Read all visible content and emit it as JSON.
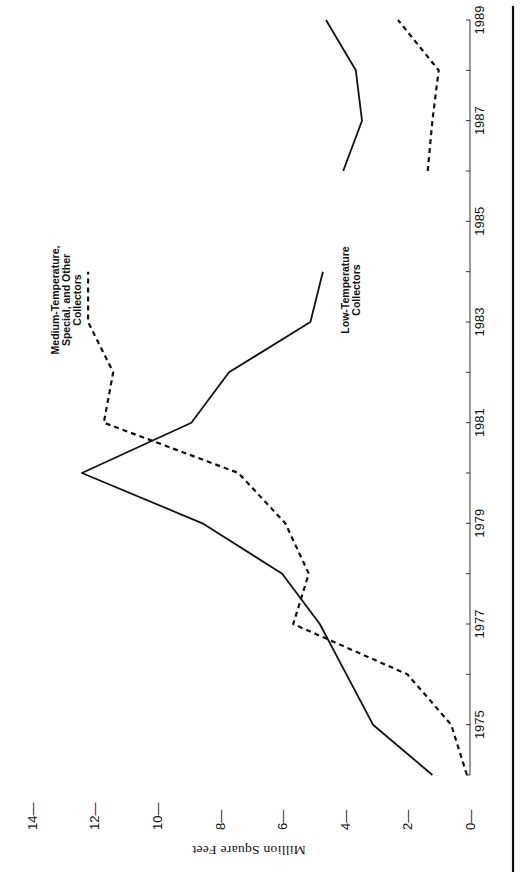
{
  "chart_data": {
    "type": "line",
    "orientation": "rotated-90",
    "title": "",
    "xlabel": "",
    "ylabel": "Million Square Feet",
    "x": [
      1974,
      1975,
      1976,
      1977,
      1978,
      1979,
      1980,
      1981,
      1982,
      1983,
      1984,
      1985,
      1986,
      1987,
      1988,
      1989
    ],
    "x_tick_labels": [
      "1975",
      "1977",
      "1979",
      "1981",
      "1983",
      "1985",
      "1987",
      "1989"
    ],
    "xlim": [
      1974,
      1989
    ],
    "ylim": [
      0,
      14
    ],
    "y_ticks": [
      0,
      2,
      4,
      6,
      8,
      10,
      12,
      14
    ],
    "y_tick_labels": [
      "0",
      "2",
      "4",
      "6",
      "8",
      "10",
      "12",
      "14"
    ],
    "grid": false,
    "legend": "inline labels",
    "series": [
      {
        "name": "Low-Temperature Collectors",
        "label_lines": [
          "Low-Temperature",
          "Collectors"
        ],
        "style": "solid",
        "color": "#111111",
        "values": [
          1.2,
          3.1,
          3.95,
          4.8,
          6.0,
          8.55,
          12.4,
          8.9,
          7.7,
          5.1,
          4.7,
          null,
          4.05,
          3.45,
          3.65,
          4.6
        ]
      },
      {
        "name": "Medium-Temperature, Special, and Other Collectors",
        "label_lines": [
          "Medium-Temperature,",
          "Special, and Other",
          "Collectors"
        ],
        "style": "dashed",
        "color": "#111111",
        "values": [
          0.1,
          0.6,
          2.0,
          5.65,
          5.15,
          5.9,
          7.4,
          11.7,
          11.4,
          12.2,
          12.2,
          null,
          1.35,
          1.2,
          1.0,
          2.3
        ]
      }
    ]
  }
}
